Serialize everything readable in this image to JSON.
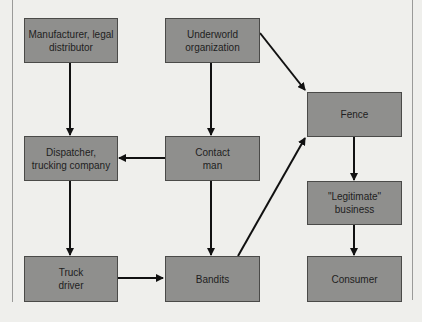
{
  "diagram": {
    "nodes": [
      {
        "id": "manufacturer",
        "label": "Manufacturer, legal\ndistributor"
      },
      {
        "id": "underworld",
        "label": "Underworld\norganization"
      },
      {
        "id": "fence",
        "label": "Fence"
      },
      {
        "id": "dispatcher",
        "label": "Dispatcher,\ntrucking company"
      },
      {
        "id": "contact",
        "label": "Contact\nman"
      },
      {
        "id": "legitimate",
        "label": "\"Legitimate\"\nbusiness"
      },
      {
        "id": "truck_driver",
        "label": "Truck\ndriver"
      },
      {
        "id": "bandits",
        "label": "Bandits"
      },
      {
        "id": "consumer",
        "label": "Consumer"
      }
    ],
    "edges": [
      {
        "from": "manufacturer",
        "to": "dispatcher"
      },
      {
        "from": "underworld",
        "to": "contact"
      },
      {
        "from": "underworld",
        "to": "fence"
      },
      {
        "from": "contact",
        "to": "dispatcher"
      },
      {
        "from": "contact",
        "to": "bandits"
      },
      {
        "from": "dispatcher",
        "to": "truck_driver"
      },
      {
        "from": "truck_driver",
        "to": "bandits"
      },
      {
        "from": "bandits",
        "to": "fence"
      },
      {
        "from": "fence",
        "to": "legitimate"
      },
      {
        "from": "legitimate",
        "to": "consumer"
      }
    ]
  },
  "colors": {
    "background": "#efefec",
    "box_fill": "#8f8f8d",
    "box_border": "#4a4a48",
    "arrow": "#111111"
  }
}
